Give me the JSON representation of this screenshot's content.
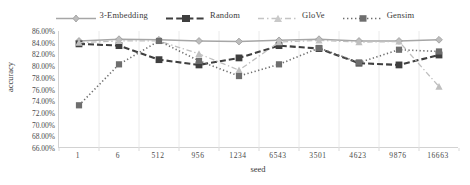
{
  "chart_data": {
    "type": "line",
    "title": "",
    "xlabel": "seed",
    "ylabel": "accuracy",
    "categories": [
      "1",
      "6",
      "512",
      "956",
      "1234",
      "6543",
      "3501",
      "4623",
      "9876",
      "16663"
    ],
    "ylim": [
      66,
      86
    ],
    "ytick_labels": [
      "86.00%",
      "84.00%",
      "82.00%",
      "80.00%",
      "78.00%",
      "76.00%",
      "74.00%",
      "72.00%",
      "70.00%",
      "68.00%",
      "66.00%"
    ],
    "ytick_values": [
      86,
      84,
      82,
      80,
      78,
      76,
      74,
      72,
      70,
      68,
      66
    ],
    "grid": "vertical",
    "legend_position": "top-center",
    "series": [
      {
        "name": "3-Embedding",
        "color": "#a6a6a6",
        "marker": "diamond",
        "dash": "solid",
        "values": [
          84.3,
          84.6,
          84.5,
          84.3,
          84.2,
          84.4,
          84.6,
          84.3,
          84.3,
          84.5
        ]
      },
      {
        "name": "Random",
        "color": "#3f3f3f",
        "marker": "square",
        "dash": "dashed",
        "values": [
          83.8,
          83.5,
          81.1,
          80.2,
          81.4,
          83.5,
          83.0,
          80.5,
          80.2,
          81.9
        ]
      },
      {
        "name": "GloVe",
        "color": "#bfbfbf",
        "marker": "triangle",
        "dash": "dash-dot",
        "values": [
          84.0,
          84.3,
          84.3,
          82.1,
          79.3,
          84.1,
          84.4,
          84.1,
          84.2,
          76.5
        ]
      },
      {
        "name": "Gensim",
        "color": "#6e6e6e",
        "marker": "square",
        "dash": "dotted",
        "values": [
          73.3,
          80.3,
          84.3,
          80.9,
          78.3,
          80.3,
          83.1,
          80.6,
          82.8,
          82.5
        ]
      }
    ]
  },
  "legend": {
    "items": [
      {
        "label": "3-Embedding"
      },
      {
        "label": "Random"
      },
      {
        "label": "GloVe"
      },
      {
        "label": "Gensim"
      }
    ]
  }
}
